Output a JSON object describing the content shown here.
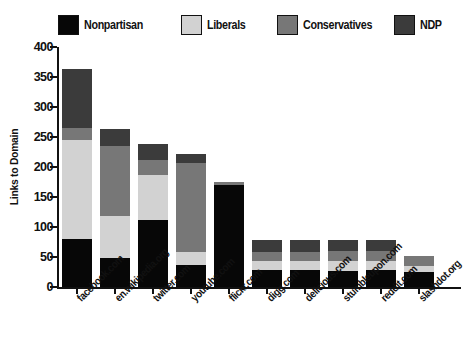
{
  "chart_data": {
    "type": "bar",
    "subtype": "stacked-vertical",
    "title": "",
    "xlabel": "",
    "ylabel": "Links to Domain",
    "ylim": [
      0,
      400
    ],
    "yticks": [
      0,
      50,
      100,
      150,
      200,
      250,
      300,
      350,
      400
    ],
    "ytick_labels": [
      "0",
      "50",
      "100",
      "150",
      "200",
      "250",
      "300",
      "350",
      "400"
    ],
    "grid": false,
    "legend_position": "top",
    "categories": [
      "facebook.com",
      "en.wikipedia.org",
      "twitter.com",
      "youtube.com",
      "flickr.com",
      "digg.com",
      "delicious.com",
      "stumbleupon.com",
      "reddit.com",
      "slashdot.org"
    ],
    "series": [
      {
        "name": "Nonpartisan",
        "color": "#070707",
        "values": [
          80,
          48,
          112,
          37,
          170,
          28,
          28,
          27,
          28,
          25
        ]
      },
      {
        "name": "Liberals",
        "color": "#d2d2d2",
        "values": [
          165,
          70,
          75,
          21,
          0,
          15,
          16,
          17,
          16,
          10
        ]
      },
      {
        "name": "Conservatives",
        "color": "#777777",
        "values": [
          20,
          117,
          25,
          149,
          5,
          15,
          15,
          16,
          16,
          17
        ]
      },
      {
        "name": "NDP",
        "color": "#3b3b3b",
        "values": [
          98,
          28,
          26,
          15,
          0,
          20,
          19,
          18,
          18,
          0
        ]
      }
    ],
    "totals": [
      363,
      263,
      238,
      222,
      175,
      78,
      78,
      78,
      78,
      52
    ]
  },
  "legend": {
    "entries": [
      {
        "label": "Nonpartisan",
        "color": "#070707"
      },
      {
        "label": "Liberals",
        "color": "#d2d2d2"
      },
      {
        "label": "Conservatives",
        "color": "#777777"
      },
      {
        "label": "NDP",
        "color": "#3b3b3b"
      }
    ]
  }
}
